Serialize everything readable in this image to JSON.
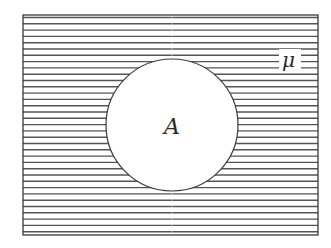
{
  "diagram": {
    "type": "venn",
    "universal_set": {
      "label": "μ",
      "x": 23,
      "y": 15,
      "width": 295,
      "height": 220,
      "shading": "horizontal-lines"
    },
    "set": {
      "label": "A",
      "cx": 172,
      "cy": 125,
      "r": 66,
      "fill": "#ffffff"
    },
    "shading": {
      "line_spacing": 6.3,
      "line_color": "#555555",
      "line_width": 1.4
    },
    "colors": {
      "border": "#3a3a3a",
      "background": "#ffffff"
    }
  }
}
